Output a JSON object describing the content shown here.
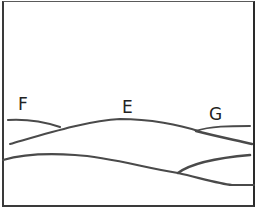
{
  "diagram": {
    "labels": {
      "f": "F",
      "e": "E",
      "g": "G"
    },
    "colors": {
      "stroke": "#4a4a4a",
      "background": "#ffffff"
    }
  }
}
